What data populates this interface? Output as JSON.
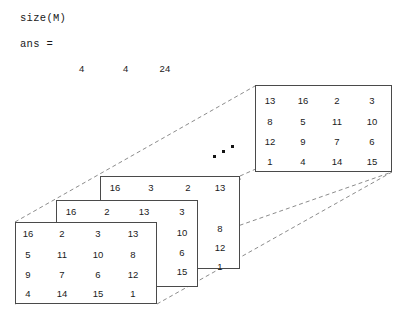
{
  "console": {
    "command": "size(M)",
    "answer_label": "ans =",
    "dims": [
      "4",
      "4",
      "24"
    ]
  },
  "figure": {
    "caption": "3-D stack of 4x4 magic square layers",
    "ellipsis_name": "continuation-dots",
    "line_color": "#4a4a4a",
    "dash_color": "#8c8c8c",
    "text_color": "#1a1a1a"
  },
  "layers": [
    {
      "id": "back-layer",
      "label": "layer-24",
      "rows": [
        [
          "13",
          "16",
          "2",
          "3"
        ],
        [
          "8",
          "5",
          "11",
          "10"
        ],
        [
          "12",
          "9",
          "7",
          "6"
        ],
        [
          "1",
          "4",
          "14",
          "15"
        ]
      ]
    },
    {
      "id": "third-layer",
      "label": "layer-3",
      "top_row": [
        "16",
        "3",
        "2",
        "13"
      ],
      "right_col": [
        "13",
        "8",
        "12",
        "1"
      ]
    },
    {
      "id": "second-layer",
      "label": "layer-2",
      "top_row": [
        "16",
        "2",
        "13"
      ],
      "right_col": [
        "3",
        "10",
        "6",
        "15"
      ]
    },
    {
      "id": "front-layer",
      "label": "layer-1",
      "rows": [
        [
          "16",
          "2",
          "3",
          "13"
        ],
        [
          "5",
          "11",
          "10",
          "8"
        ],
        [
          "9",
          "7",
          "6",
          "12"
        ],
        [
          "4",
          "14",
          "15",
          "1"
        ]
      ]
    }
  ]
}
